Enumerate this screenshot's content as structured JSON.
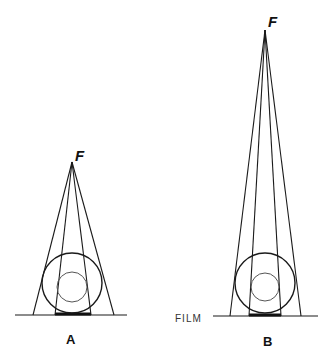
{
  "figure": {
    "panels": [
      {
        "id": "A",
        "label": "A",
        "focal_label": "F",
        "apex": {
          "x": 72,
          "y": 162
        },
        "film_y": 315,
        "film_x": [
          15,
          127
        ],
        "outer_feet": [
          33,
          114
        ],
        "inner_feet": [
          55,
          91
        ],
        "outer_circle": {
          "cx": 72,
          "cy": 283,
          "r": 30
        },
        "inner_circle": {
          "cx": 72,
          "cy": 287,
          "r": 15
        }
      },
      {
        "id": "B",
        "label": "B",
        "focal_label": "F",
        "apex": {
          "x": 265,
          "y": 30
        },
        "film_y": 316,
        "film_x": [
          213,
          318
        ],
        "outer_feet": [
          230,
          301
        ],
        "inner_feet": [
          249,
          281
        ],
        "outer_circle": {
          "cx": 265,
          "cy": 283,
          "r": 30
        },
        "inner_circle": {
          "cx": 265,
          "cy": 287,
          "r": 14
        }
      }
    ],
    "film_label": "FILM"
  }
}
